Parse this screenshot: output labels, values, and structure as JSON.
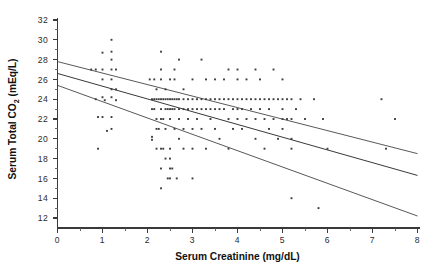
{
  "chart_data": {
    "type": "scatter",
    "title": "",
    "xlabel": "Serum Creatinine (mg/dL)",
    "ylabel_main": "Serum Total CO",
    "ylabel_sub": "2",
    "ylabel_unit": "(mEq/L)",
    "ylabel": "Serum Total CO2 (mEq/L)",
    "xlim": [
      0,
      8
    ],
    "ylim": [
      11,
      32
    ],
    "xticks": [
      0,
      1,
      2,
      3,
      4,
      5,
      6,
      7,
      8
    ],
    "xticklabels": [
      "0",
      "1",
      "2",
      "3",
      "4",
      "5",
      "6",
      "7",
      "8"
    ],
    "xminorticks": [
      0.5,
      1.5,
      2.5,
      3.5,
      4.5,
      5.5,
      6.5,
      7.5
    ],
    "yticks": [
      12,
      14,
      16,
      18,
      20,
      22,
      24,
      26,
      28,
      30,
      32
    ],
    "yticklabels": [
      "12",
      "14",
      "16",
      "18",
      "20",
      "22",
      "24",
      "26",
      "28",
      "30",
      "32"
    ],
    "yminorticks": [
      13,
      15,
      17,
      19,
      21,
      23,
      25,
      27,
      29,
      31
    ],
    "grid": false,
    "legend": "none",
    "point_color": "#3c3c3c",
    "line_color": "#2e2e2e",
    "axis_color": "#3a3a3a",
    "series": [
      {
        "name": "Serum Total CO2 vs Serum Creatinine",
        "marker": "dot",
        "points": [
          [
            0.9,
            19.0
          ],
          [
            1.0,
            28.7
          ],
          [
            1.0,
            27.0
          ],
          [
            1.0,
            26.0
          ],
          [
            1.0,
            24.2
          ],
          [
            1.0,
            22.2
          ],
          [
            1.05,
            23.9
          ],
          [
            1.1,
            20.8
          ],
          [
            1.2,
            30.0
          ],
          [
            1.2,
            28.8
          ],
          [
            1.2,
            28.0
          ],
          [
            1.2,
            27.0
          ],
          [
            1.2,
            26.0
          ],
          [
            1.2,
            25.0
          ],
          [
            1.2,
            24.2
          ],
          [
            1.2,
            22.2
          ],
          [
            1.2,
            21.0
          ],
          [
            1.3,
            27.0
          ],
          [
            1.3,
            25.0
          ],
          [
            1.3,
            23.9
          ],
          [
            0.75,
            27.0
          ],
          [
            0.85,
            27.0
          ],
          [
            0.85,
            24.0
          ],
          [
            0.9,
            22.2
          ],
          [
            2.05,
            26.0
          ],
          [
            2.1,
            24.0
          ],
          [
            2.1,
            23.0
          ],
          [
            2.1,
            20.2
          ],
          [
            2.1,
            19.9
          ],
          [
            2.15,
            26.0
          ],
          [
            2.15,
            24.0
          ],
          [
            2.15,
            23.0
          ],
          [
            2.2,
            25.0
          ],
          [
            2.2,
            24.0
          ],
          [
            2.2,
            22.0
          ],
          [
            2.2,
            21.0
          ],
          [
            2.2,
            19.0
          ],
          [
            2.25,
            24.0
          ],
          [
            2.25,
            21.0
          ],
          [
            2.3,
            28.8
          ],
          [
            2.3,
            27.0
          ],
          [
            2.3,
            26.0
          ],
          [
            2.3,
            24.0
          ],
          [
            2.3,
            23.0
          ],
          [
            2.3,
            22.0
          ],
          [
            2.3,
            19.0
          ],
          [
            2.3,
            17.0
          ],
          [
            2.3,
            15.0
          ],
          [
            2.35,
            24.0
          ],
          [
            2.35,
            22.0
          ],
          [
            2.35,
            19.0
          ],
          [
            2.4,
            25.0
          ],
          [
            2.4,
            24.0
          ],
          [
            2.4,
            23.0
          ],
          [
            2.4,
            21.0
          ],
          [
            2.4,
            18.0
          ],
          [
            2.45,
            24.0
          ],
          [
            2.45,
            23.0
          ],
          [
            2.45,
            16.0
          ],
          [
            2.5,
            26.0
          ],
          [
            2.5,
            24.0
          ],
          [
            2.5,
            23.0
          ],
          [
            2.5,
            22.0
          ],
          [
            2.5,
            19.0
          ],
          [
            2.5,
            18.0
          ],
          [
            2.5,
            17.0
          ],
          [
            2.5,
            16.0
          ],
          [
            2.55,
            24.0
          ],
          [
            2.55,
            23.0
          ],
          [
            2.55,
            17.0
          ],
          [
            2.6,
            27.0
          ],
          [
            2.6,
            26.0
          ],
          [
            2.6,
            24.0
          ],
          [
            2.6,
            23.0
          ],
          [
            2.6,
            21.0
          ],
          [
            2.65,
            24.0
          ],
          [
            2.65,
            16.0
          ],
          [
            2.7,
            28.0
          ],
          [
            2.7,
            24.0
          ],
          [
            2.7,
            23.0
          ],
          [
            2.7,
            22.0
          ],
          [
            2.7,
            20.0
          ],
          [
            2.8,
            25.0
          ],
          [
            2.8,
            24.0
          ],
          [
            2.8,
            23.0
          ],
          [
            2.8,
            21.0
          ],
          [
            2.8,
            19.0
          ],
          [
            2.9,
            24.0
          ],
          [
            2.9,
            23.0
          ],
          [
            2.9,
            22.0
          ],
          [
            3.0,
            26.0
          ],
          [
            3.0,
            24.0
          ],
          [
            3.0,
            23.0
          ],
          [
            3.0,
            21.0
          ],
          [
            3.0,
            19.0
          ],
          [
            3.0,
            16.0
          ],
          [
            3.1,
            24.0
          ],
          [
            3.1,
            23.0
          ],
          [
            3.1,
            22.0
          ],
          [
            3.2,
            28.0
          ],
          [
            3.2,
            24.0
          ],
          [
            3.2,
            23.0
          ],
          [
            3.2,
            21.0
          ],
          [
            3.3,
            26.0
          ],
          [
            3.3,
            24.0
          ],
          [
            3.3,
            23.0
          ],
          [
            3.3,
            19.0
          ],
          [
            3.4,
            24.0
          ],
          [
            3.4,
            23.0
          ],
          [
            3.4,
            22.0
          ],
          [
            3.5,
            26.0
          ],
          [
            3.5,
            24.0
          ],
          [
            3.5,
            23.0
          ],
          [
            3.5,
            21.0
          ],
          [
            3.6,
            24.0
          ],
          [
            3.6,
            23.0
          ],
          [
            3.6,
            20.0
          ],
          [
            3.7,
            26.0
          ],
          [
            3.7,
            24.0
          ],
          [
            3.7,
            23.0
          ],
          [
            3.8,
            27.0
          ],
          [
            3.8,
            24.0
          ],
          [
            3.8,
            22.0
          ],
          [
            3.8,
            19.0
          ],
          [
            3.9,
            24.0
          ],
          [
            3.9,
            23.0
          ],
          [
            3.9,
            21.0
          ],
          [
            4.0,
            27.0
          ],
          [
            4.0,
            26.0
          ],
          [
            4.0,
            24.0
          ],
          [
            4.0,
            23.0
          ],
          [
            4.0,
            22.0
          ],
          [
            4.1,
            24.0
          ],
          [
            4.1,
            23.0
          ],
          [
            4.1,
            21.0
          ],
          [
            4.2,
            26.0
          ],
          [
            4.2,
            24.0
          ],
          [
            4.2,
            22.0
          ],
          [
            4.3,
            24.0
          ],
          [
            4.3,
            23.0
          ],
          [
            4.4,
            27.0
          ],
          [
            4.4,
            24.0
          ],
          [
            4.4,
            22.0
          ],
          [
            4.4,
            20.0
          ],
          [
            4.5,
            26.0
          ],
          [
            4.5,
            24.0
          ],
          [
            4.5,
            23.0
          ],
          [
            4.6,
            24.0
          ],
          [
            4.6,
            22.0
          ],
          [
            4.6,
            19.0
          ],
          [
            4.7,
            24.0
          ],
          [
            4.7,
            23.0
          ],
          [
            4.7,
            21.0
          ],
          [
            4.8,
            27.0
          ],
          [
            4.8,
            24.0
          ],
          [
            4.8,
            22.0
          ],
          [
            4.9,
            24.0
          ],
          [
            4.9,
            20.0
          ],
          [
            5.0,
            26.0
          ],
          [
            5.0,
            24.0
          ],
          [
            5.0,
            23.0
          ],
          [
            5.0,
            22.0
          ],
          [
            5.0,
            21.0
          ],
          [
            5.1,
            24.0
          ],
          [
            5.1,
            22.0
          ],
          [
            5.2,
            24.0
          ],
          [
            5.2,
            22.0
          ],
          [
            5.2,
            20.0
          ],
          [
            5.2,
            19.0
          ],
          [
            5.2,
            14.0
          ],
          [
            5.3,
            23.0
          ],
          [
            5.4,
            24.0
          ],
          [
            5.5,
            22.0
          ],
          [
            5.7,
            24.0
          ],
          [
            5.8,
            13.0
          ],
          [
            5.9,
            22.0
          ],
          [
            6.0,
            19.0
          ],
          [
            7.2,
            24.0
          ],
          [
            7.3,
            19.0
          ],
          [
            7.5,
            22.0
          ]
        ]
      }
    ],
    "lines": [
      {
        "name": "upper-confidence-band",
        "x": [
          0,
          8
        ],
        "y": [
          27.8,
          18.5
        ]
      },
      {
        "name": "regression-line",
        "x": [
          0,
          8
        ],
        "y": [
          26.6,
          16.3
        ]
      },
      {
        "name": "lower-confidence-band",
        "x": [
          0,
          8
        ],
        "y": [
          25.4,
          12.2
        ]
      }
    ]
  }
}
